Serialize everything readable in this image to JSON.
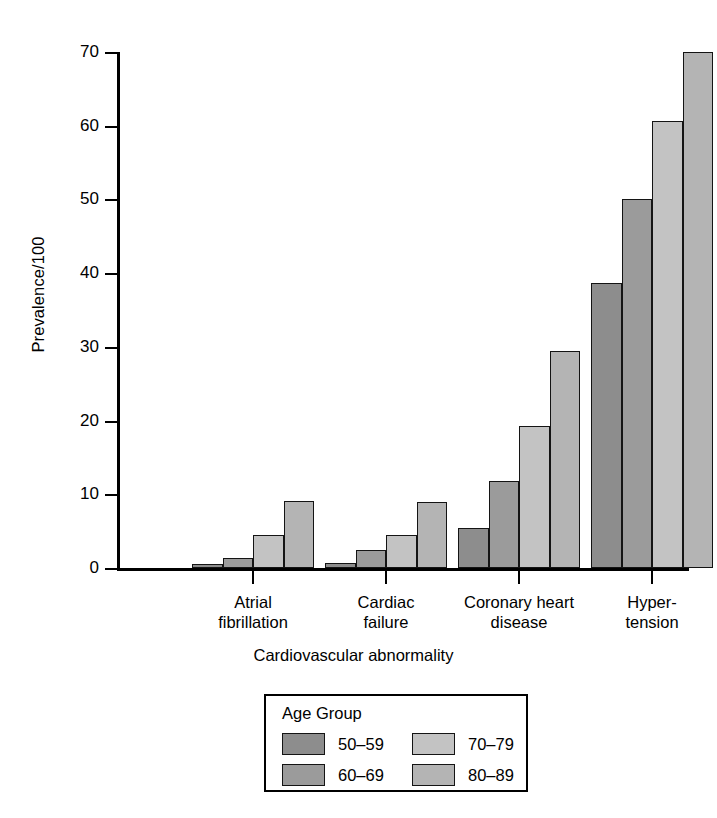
{
  "chart_data": {
    "type": "bar",
    "title": "",
    "xlabel": "Cardiovascular abnormality",
    "ylabel": "Prevalence/100",
    "categories": [
      "Atrial fibrillation",
      "Cardiac failure",
      "Coronary heart disease",
      "Hyper-tension"
    ],
    "category_lines": [
      [
        "Atrial",
        "fibrillation"
      ],
      [
        "Cardiac",
        "failure"
      ],
      [
        "Coronary heart",
        "disease"
      ],
      [
        "Hyper-",
        "tension"
      ]
    ],
    "series": [
      {
        "name": "50–59",
        "color": "#8d8d8d",
        "values": [
          0.6,
          0.7,
          5.4,
          38.7
        ]
      },
      {
        "name": "60–69",
        "color": "#9b9b9b",
        "values": [
          1.4,
          2.5,
          11.8,
          50.0
        ]
      },
      {
        "name": "70–79",
        "color": "#c3c3c3",
        "values": [
          4.5,
          4.5,
          19.3,
          60.6
        ]
      },
      {
        "name": "80–89",
        "color": "#b4b4b4",
        "values": [
          9.1,
          9.0,
          29.5,
          70.0
        ]
      }
    ],
    "ylim": [
      0,
      70
    ],
    "yticks": [
      0,
      10,
      20,
      30,
      40,
      50,
      60,
      70
    ],
    "ytick_labels": [
      "0",
      "10",
      "20",
      "30",
      "40",
      "50",
      "60",
      "70"
    ],
    "grid": false,
    "legend": {
      "title": "Age Group",
      "position": "below-outside",
      "entries": [
        {
          "label": "50–59",
          "color": "#8d8d8d"
        },
        {
          "label": "70–79",
          "color": "#c3c3c3"
        },
        {
          "label": "60–69",
          "color": "#9b9b9b"
        },
        {
          "label": "80–89",
          "color": "#b4b4b4"
        }
      ]
    }
  }
}
